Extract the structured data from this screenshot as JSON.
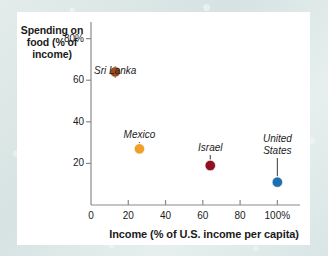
{
  "figure": {
    "background_color": "#dfe9e8",
    "card_color": "#ffffff",
    "axis_color": "#8a8a8a",
    "text_color": "#1b1b1b"
  },
  "chart_data": {
    "type": "scatter",
    "title": "",
    "xlabel": "Income (% of U.S. income per capita)",
    "ylabel": "Spending on food (% of income)",
    "xlim": [
      0,
      110
    ],
    "ylim": [
      0,
      88
    ],
    "grid": false,
    "legend": "none",
    "xticks": [
      {
        "value": 0,
        "label": "0"
      },
      {
        "value": 20,
        "label": "20"
      },
      {
        "value": 40,
        "label": "40"
      },
      {
        "value": 60,
        "label": "60"
      },
      {
        "value": 80,
        "label": "80"
      },
      {
        "value": 100,
        "label": "100%"
      }
    ],
    "yticks": [
      {
        "value": 20,
        "label": "20"
      },
      {
        "value": 40,
        "label": "40"
      },
      {
        "value": 60,
        "label": "60"
      },
      {
        "value": 80,
        "label": "80%"
      }
    ],
    "points": [
      {
        "label": "Sri Lanka",
        "x": 13,
        "y": 64,
        "color": "#9c4a1a",
        "label_lines": [
          "Sri Lanka"
        ]
      },
      {
        "label": "Mexico",
        "x": 26,
        "y": 27,
        "color": "#f0a028",
        "label_lines": [
          "Mexico"
        ]
      },
      {
        "label": "Israel",
        "x": 64,
        "y": 19,
        "color": "#8f1020",
        "label_lines": [
          "Israel"
        ]
      },
      {
        "label": "United States",
        "x": 100,
        "y": 11,
        "color": "#1f6fad",
        "label_lines": [
          "United",
          "States"
        ]
      }
    ]
  }
}
